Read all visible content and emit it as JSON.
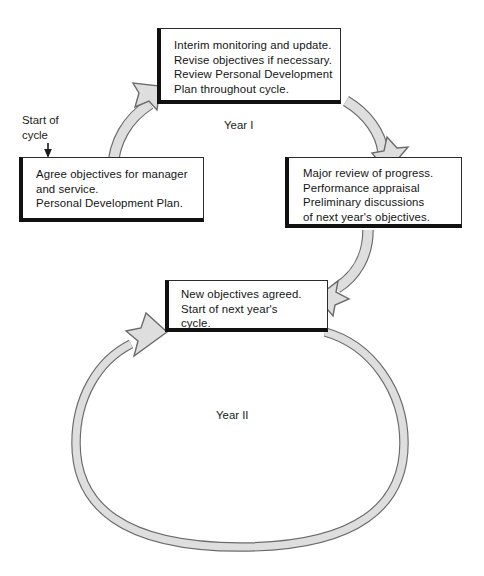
{
  "diagram": {
    "colors": {
      "ribbon_fill": "#dcdcdc",
      "ribbon_stroke": "#6b6b6b",
      "box_border": "#2b2b2b",
      "box_shadow": "#111111",
      "text": "#141414",
      "background": "#ffffff"
    },
    "boxes": [
      {
        "id": "top",
        "name": "interim-monitoring-box",
        "text": "Interim monitoring and update.\nRevise objectives if necessary.\nReview Personal Development\nPlan throughout cycle."
      },
      {
        "id": "left",
        "name": "agree-objectives-box",
        "text": "Agree objectives for manager\nand service.\nPersonal Development Plan."
      },
      {
        "id": "right",
        "name": "major-review-box",
        "text": "Major review of progress.\nPerformance appraisal\nPreliminary discussions\nof next year's objectives."
      },
      {
        "id": "bottom",
        "name": "new-objectives-box",
        "text": "New objectives agreed.\nStart of next year's\ncycle."
      }
    ],
    "labels": {
      "start_of_cycle": "Start of\ncycle",
      "year_one": "Year I",
      "year_two": "Year II"
    },
    "connectors": [
      {
        "id": "left-to-top",
        "from": "agree-objectives-box",
        "to": "interim-monitoring-box",
        "style": "curved-ribbon-arrow",
        "direction": "up-right"
      },
      {
        "id": "top-to-right",
        "from": "interim-monitoring-box",
        "to": "major-review-box",
        "style": "curved-ribbon-arrow",
        "direction": "down-right"
      },
      {
        "id": "right-to-bottom",
        "from": "major-review-box",
        "to": "new-objectives-box",
        "style": "curved-ribbon-arrow",
        "direction": "down-left"
      },
      {
        "id": "bottom-loop",
        "from": "new-objectives-box",
        "to": "new-objectives-box",
        "style": "large-circular-ribbon-arrow",
        "direction": "counter-clockwise"
      },
      {
        "id": "entry-arrow",
        "from": "start_of_cycle_label",
        "to": "agree-objectives-box",
        "style": "thin-elbow-arrow",
        "direction": "down"
      }
    ]
  }
}
